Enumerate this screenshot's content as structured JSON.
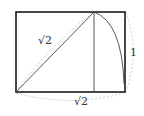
{
  "diagram": {
    "labels": {
      "diagonal": "√2",
      "bottom": "√2",
      "right": "1"
    },
    "colors": {
      "stroke": "#1a1a1a",
      "thin_stroke": "#444444",
      "dashed": "#c8c8c8",
      "background": "#ffffff"
    },
    "rectangle": {
      "x": 16,
      "y": 12,
      "width": 109,
      "height": 80
    },
    "square_split_x": 94
  }
}
